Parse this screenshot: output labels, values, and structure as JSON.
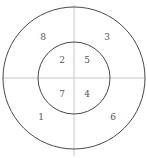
{
  "figure": {
    "type": "concentric-circles-quadrant-diagram",
    "background_color": "#ffffff",
    "circle_stroke_color": "#4a4a4a",
    "axis_stroke_color": "#c8c8c8",
    "label_color": "#555555",
    "center": {
      "x": 74,
      "y": 78
    },
    "outer_circle": {
      "radius": 71
    },
    "inner_circle": {
      "radius": 36
    },
    "axes": {
      "horizontal": {
        "x1": 2,
        "y1": 78,
        "x2": 145,
        "y2": 78
      },
      "vertical": {
        "x1": 74,
        "y1": 5,
        "x2": 74,
        "y2": 156
      }
    },
    "regions": [
      {
        "id": "region-1",
        "label": "1",
        "ring": "outer",
        "quadrant": "lower-left",
        "x": 41,
        "y": 118
      },
      {
        "id": "region-2",
        "label": "2",
        "ring": "inner",
        "quadrant": "upper-left",
        "x": 62,
        "y": 61
      },
      {
        "id": "region-3",
        "label": "3",
        "ring": "outer",
        "quadrant": "upper-right",
        "x": 107,
        "y": 38
      },
      {
        "id": "region-4",
        "label": "4",
        "ring": "inner",
        "quadrant": "lower-right",
        "x": 87,
        "y": 95
      },
      {
        "id": "region-5",
        "label": "5",
        "ring": "inner",
        "quadrant": "upper-right",
        "x": 87,
        "y": 61
      },
      {
        "id": "region-6",
        "label": "6",
        "ring": "outer",
        "quadrant": "lower-right",
        "x": 113,
        "y": 118
      },
      {
        "id": "region-7",
        "label": "7",
        "ring": "inner",
        "quadrant": "lower-left",
        "x": 62,
        "y": 95
      },
      {
        "id": "region-8",
        "label": "8",
        "ring": "outer",
        "quadrant": "upper-left",
        "x": 43,
        "y": 38
      }
    ]
  },
  "chart_data": {
    "type": "diagram",
    "title": "",
    "subtitle": "",
    "xlabel": "",
    "ylabel": "",
    "categories": [
      "1",
      "2",
      "3",
      "4",
      "5",
      "6",
      "7",
      "8"
    ],
    "values": [
      1,
      2,
      3,
      4,
      5,
      6,
      7,
      8
    ],
    "annotations": [
      {
        "text": "8",
        "region": "outer annulus, upper-left quadrant"
      },
      {
        "text": "3",
        "region": "outer annulus, upper-right quadrant"
      },
      {
        "text": "2",
        "region": "inner disc, upper-left quadrant"
      },
      {
        "text": "5",
        "region": "inner disc, upper-right quadrant"
      },
      {
        "text": "7",
        "region": "inner disc, lower-left quadrant"
      },
      {
        "text": "4",
        "region": "inner disc, lower-right quadrant"
      },
      {
        "text": "1",
        "region": "outer annulus, lower-left quadrant"
      },
      {
        "text": "6",
        "region": "outer annulus, lower-right quadrant"
      }
    ],
    "legend": [],
    "grid": false
  }
}
